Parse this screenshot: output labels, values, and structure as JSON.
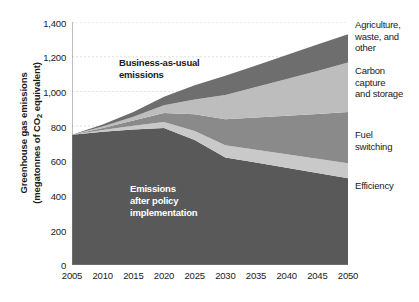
{
  "chart_data": {
    "type": "area",
    "title": "",
    "subtitle": "",
    "xlabel": "",
    "ylabel": "Greenhouse gas emissions (megatonnes of CO2 equivalent)",
    "ylabel_line1": "Greenhouse gas emissions",
    "ylabel_line2_pre": "(megatonnes of CO",
    "ylabel_line2_sub": "2",
    "ylabel_line2_post": " equivalent)",
    "stacked": true,
    "grid": true,
    "legend_position": "right",
    "xlim": [
      2005,
      2050
    ],
    "ylim": [
      0,
      1400
    ],
    "ytick_step": 200,
    "x": [
      2005,
      2010,
      2015,
      2020,
      2025,
      2030,
      2035,
      2040,
      2045,
      2050
    ],
    "yticks": [
      "0",
      "200",
      "400",
      "600",
      "800",
      "1,000",
      "1,200",
      "1,400"
    ],
    "ytick_values": [
      0,
      200,
      400,
      600,
      800,
      1000,
      1200,
      1400
    ],
    "xticks": [
      "2005",
      "2010",
      "2015",
      "2020",
      "2025",
      "2030",
      "2035",
      "2040",
      "2045",
      "2050"
    ],
    "series": [
      {
        "name": "Emissions after policy implementation",
        "color": "#595959",
        "values": [
          750,
          768,
          780,
          790,
          720,
          620,
          590,
          560,
          530,
          500
        ]
      },
      {
        "name": "Efficiency",
        "color": "#c9c9c9",
        "values": [
          0,
          10,
          22,
          34,
          52,
          70,
          74,
          78,
          82,
          86
        ]
      },
      {
        "name": "Fuel switching",
        "color": "#8a8a8a",
        "values": [
          0,
          12,
          30,
          52,
          96,
          150,
          186,
          222,
          258,
          296
        ]
      },
      {
        "name": "Carbon capture and storage",
        "color": "#bdbdbd",
        "values": [
          0,
          8,
          22,
          44,
          86,
          140,
          176,
          212,
          248,
          284
        ]
      },
      {
        "name": "Agriculture, waste, and other",
        "color": "#6e6e6e",
        "values": [
          0,
          12,
          28,
          50,
          82,
          110,
          124,
          138,
          152,
          164
        ]
      }
    ],
    "totals_bau": [
      750,
      810,
      882,
      970,
      1036,
      1090,
      1150,
      1210,
      1270,
      1330
    ],
    "annotations": [
      {
        "name": "business-as-usual",
        "text_line1": "Business-as-usual",
        "text_line2": "emissions",
        "color": "#1a1a1a"
      },
      {
        "name": "after-policy",
        "text_line1": "Emissions",
        "text_line2": "after policy",
        "text_line3": "implementation",
        "color": "#ffffff"
      }
    ],
    "legend": [
      {
        "line1": "Agriculture,",
        "line2": "waste, and",
        "line3": "other",
        "color": "#6e6e6e"
      },
      {
        "line1": "Carbon",
        "line2": "capture",
        "line3": "and storage",
        "color": "#bdbdbd"
      },
      {
        "line1": "Fuel",
        "line2": "switching",
        "line3": "",
        "color": "#8a8a8a"
      },
      {
        "line1": "Efficiency",
        "line2": "",
        "line3": "",
        "color": "#c9c9c9"
      }
    ],
    "colors": {
      "background": "#ffffff",
      "grid": "#d8d8d8",
      "axis": "#808080",
      "text": "#1a1a1a"
    }
  }
}
